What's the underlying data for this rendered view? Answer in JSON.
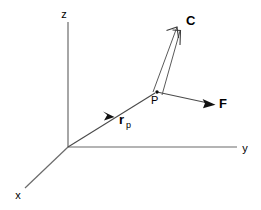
{
  "figure": {
    "background_color": "#ffffff",
    "line_color": "#6b6b6b",
    "vector_color": "#4a4a4a",
    "text_color": "#000000"
  },
  "axes": {
    "z_label": "z",
    "y_label": "y",
    "x_label": "x",
    "origin_label": ""
  },
  "vectors": {
    "position": {
      "label": "r",
      "subscript": "p",
      "name": "position-vector-rp"
    },
    "force": {
      "label": "F",
      "name": "force-vector-F"
    },
    "couple": {
      "label": "C",
      "name": "couple-vector-C"
    }
  },
  "points": {
    "p": {
      "label": "P"
    }
  }
}
